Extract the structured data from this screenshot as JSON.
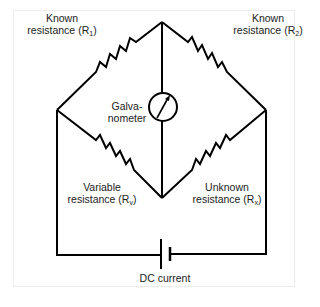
{
  "diagram": {
    "type": "Wheatstone bridge circuit",
    "labels": {
      "r1": {
        "line1": "Known",
        "line2_prefix": "resistance (R",
        "subscript": "1",
        "suffix": ")"
      },
      "r2": {
        "line1": "Known",
        "line2_prefix": "resistance (R",
        "subscript": "2",
        "suffix": ")"
      },
      "rv": {
        "line1": "Variable",
        "line2_prefix": "resistance (R",
        "subscript": "v",
        "suffix": ")"
      },
      "rx": {
        "line1": "Unknown",
        "line2_prefix": "resistance (R",
        "subscript": "x",
        "suffix": ")"
      },
      "galvanometer": {
        "line1": "Galva-",
        "line2": "nometer"
      },
      "source": "DC current"
    },
    "colors": {
      "line": "#000000",
      "text": "#222222",
      "frame": "#ececec"
    }
  }
}
